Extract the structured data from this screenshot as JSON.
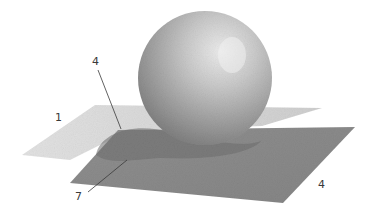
{
  "illustration": {
    "subject": "Pencil drawing of a sphere resting on overlapping planes with cast shadow",
    "labels": [
      {
        "id": "light-plane-label",
        "text": "1"
      },
      {
        "id": "shadow-edge-label",
        "text": "4"
      },
      {
        "id": "cast-shadow-label",
        "text": "7"
      },
      {
        "id": "front-plane-label",
        "text": "4"
      }
    ],
    "colors": {
      "background": "#ffffff",
      "light_plane": "#d9d9d9",
      "dark_plane": "#8a8a8a",
      "cast_shadow": "#6e6e6e",
      "sphere_highlight": "#e6e6e6",
      "sphere_shadow": "#7a7a7a",
      "ink": "#3a3a3a"
    }
  }
}
